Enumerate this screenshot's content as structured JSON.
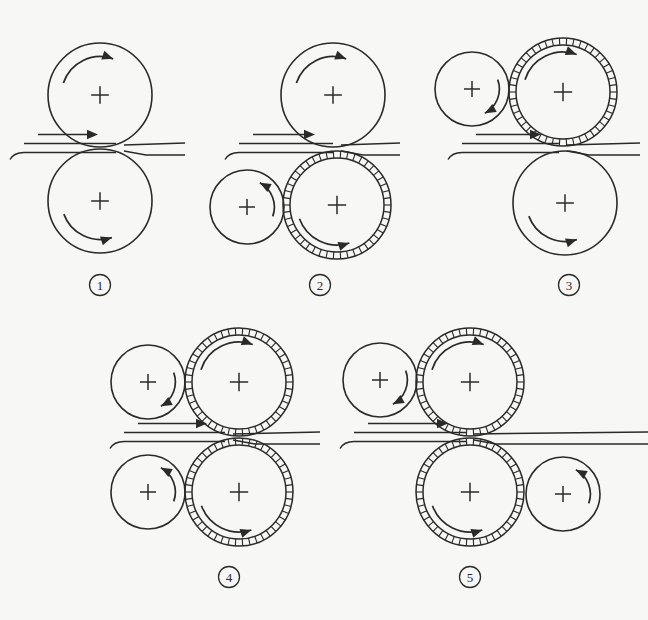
{
  "figure": {
    "background_color": "#f7f7f5",
    "ink_color": "#2a2a28",
    "width": 648,
    "height": 620
  },
  "labels": {
    "panel1": "①",
    "panel2": "②",
    "panel3": "③",
    "panel4": "④",
    "panel5": "⑤"
  },
  "chart_data": {
    "type": "diagram",
    "panels": [
      {
        "id": "panel1",
        "label": "①",
        "label_x": 100,
        "label_y": 285,
        "description": "Two-high mill: two plain work rolls of equal size",
        "strip": {
          "nip_x": 120,
          "nip_y": 148,
          "entry_dir": "left-to-right",
          "entry_thickness": 9,
          "exit_thickness": 6,
          "entry_x": 10,
          "exit_x": 185
        },
        "arrow_label": "entry-arrow",
        "rolls": [
          {
            "name": "top-work-roll",
            "cx": 100,
            "cy": 95,
            "r": 52,
            "rim": "plain",
            "spin": "clockwise",
            "arrow_side": "left-lower",
            "cross": true
          },
          {
            "name": "bottom-work-roll",
            "cx": 100,
            "cy": 201,
            "r": 52,
            "rim": "plain",
            "spin": "clockwise",
            "arrow_side": "left-upper",
            "cross": true
          }
        ]
      },
      {
        "id": "panel2",
        "label": "②",
        "label_x": 320,
        "label_y": 285,
        "description": "Work roll on top, hatched backup-driven roll below with small side roll",
        "strip": {
          "nip_x": 337,
          "nip_y": 148,
          "entry_dir": "left-to-right",
          "entry_thickness": 9,
          "exit_thickness": 6,
          "entry_x": 225,
          "exit_x": 400
        },
        "rolls": [
          {
            "name": "top-work-roll",
            "cx": 333,
            "cy": 95,
            "r": 52,
            "rim": "plain",
            "spin": "clockwise",
            "arrow_side": "left-lower",
            "cross": true
          },
          {
            "name": "bottom-hatched-roll",
            "cx": 337,
            "cy": 205,
            "r": 54,
            "rim": "hatched",
            "spin": "counter-clockwise",
            "arrow_side": "left-upper",
            "cross": true
          },
          {
            "name": "bottom-small-side-roll",
            "cx": 247,
            "cy": 207,
            "r": 37,
            "rim": "plain",
            "spin": "counter-clockwise",
            "arrow_side": "top-right",
            "cross": true
          }
        ]
      },
      {
        "id": "panel3",
        "label": "③",
        "label_x": 569,
        "label_y": 285,
        "description": "Hatched roll on top with small side roll, plain work roll below",
        "strip": {
          "nip_x": 563,
          "nip_y": 148,
          "entry_dir": "left-to-right",
          "entry_thickness": 9,
          "exit_thickness": 6,
          "entry_x": 448,
          "exit_x": 640
        },
        "rolls": [
          {
            "name": "top-hatched-roll",
            "cx": 563,
            "cy": 92,
            "r": 54,
            "rim": "hatched",
            "spin": "clockwise",
            "arrow_side": "left-lower",
            "cross": true
          },
          {
            "name": "top-small-side-roll",
            "cx": 472,
            "cy": 89,
            "r": 37,
            "rim": "plain",
            "spin": "clockwise",
            "arrow_side": "bottom-right",
            "cross": true
          },
          {
            "name": "bottom-work-roll",
            "cx": 565,
            "cy": 203,
            "r": 52,
            "rim": "plain",
            "spin": "counter-clockwise",
            "arrow_side": "left-upper",
            "cross": true
          }
        ]
      },
      {
        "id": "panel4",
        "label": "④",
        "label_x": 229,
        "label_y": 577,
        "description": "Two hatched rolls, each with a small plain side roll on the left",
        "strip": {
          "nip_x": 229,
          "nip_y": 437,
          "entry_dir": "left-to-right",
          "entry_thickness": 9,
          "exit_thickness": 6,
          "entry_x": 110,
          "exit_x": 320
        },
        "rolls": [
          {
            "name": "top-hatched-roll",
            "cx": 239,
            "cy": 382,
            "r": 54,
            "rim": "hatched",
            "spin": "clockwise",
            "arrow_side": "left-lower",
            "cross": true
          },
          {
            "name": "top-small-side-roll",
            "cx": 148,
            "cy": 382,
            "r": 37,
            "rim": "plain",
            "spin": "clockwise",
            "arrow_side": "bottom-right",
            "cross": true
          },
          {
            "name": "bottom-hatched-roll",
            "cx": 239,
            "cy": 492,
            "r": 54,
            "rim": "hatched",
            "spin": "counter-clockwise",
            "arrow_side": "left-upper",
            "cross": true
          },
          {
            "name": "bottom-small-side-roll",
            "cx": 148,
            "cy": 492,
            "r": 37,
            "rim": "plain",
            "spin": "counter-clockwise",
            "arrow_side": "top-right",
            "cross": true
          }
        ]
      },
      {
        "id": "panel5",
        "label": "⑤",
        "label_x": 470,
        "label_y": 577,
        "description": "Two hatched rolls with small side rolls on opposite sides (staggered)",
        "strip": {
          "nip_x": 470,
          "nip_y": 437,
          "entry_dir": "left-to-right",
          "entry_thickness": 9,
          "exit_thickness": 6,
          "entry_x": 340,
          "exit_x": 648
        },
        "rolls": [
          {
            "name": "top-hatched-roll",
            "cx": 470,
            "cy": 382,
            "r": 54,
            "rim": "hatched",
            "spin": "clockwise",
            "arrow_side": "left-lower",
            "cross": true
          },
          {
            "name": "top-small-side-roll",
            "cx": 380,
            "cy": 380,
            "r": 37,
            "rim": "plain",
            "spin": "clockwise",
            "arrow_side": "bottom-right",
            "cross": true
          },
          {
            "name": "bottom-hatched-roll",
            "cx": 470,
            "cy": 492,
            "r": 54,
            "rim": "hatched",
            "spin": "clockwise",
            "arrow_side": "left-upper",
            "cross": true
          },
          {
            "name": "bottom-small-side-roll",
            "cx": 563,
            "cy": 494,
            "r": 37,
            "rim": "plain",
            "spin": "counter-clockwise",
            "arrow_side": "top-right",
            "cross": true
          }
        ]
      }
    ]
  }
}
